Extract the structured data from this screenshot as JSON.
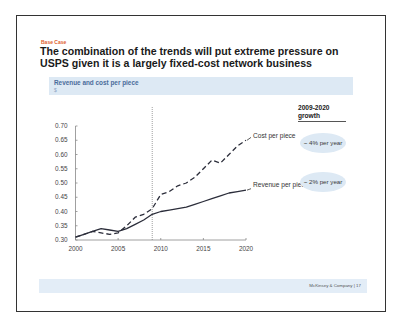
{
  "slide": {
    "tag": "Base Case",
    "title": "The combination of the trends will put extreme pressure on USPS given it is a largely fixed-cost network business",
    "chart_header": {
      "title": "Revenue and cost per piece",
      "unit": "$"
    },
    "growth": {
      "header": "2009-2020 growth",
      "cost": "~ 4% per year",
      "revenue": "~ 2% per year"
    },
    "labels": {
      "cost": "Cost per piece",
      "revenue": "Revenue per piece"
    },
    "footer": {
      "company": "McKinsey & Company",
      "separator": "|",
      "page": "17"
    },
    "colors": {
      "tag": "#e0602e",
      "header_band": "#dde9f4",
      "chart_title": "#4a6c9b",
      "line": "#2b2d3a"
    }
  },
  "chart_data": {
    "type": "line",
    "title": "Revenue and cost per piece",
    "ylabel": "$",
    "xlabel": "",
    "x": [
      2000,
      2001,
      2002,
      2003,
      2004,
      2005,
      2006,
      2007,
      2008,
      2009,
      2010,
      2011,
      2012,
      2013,
      2014,
      2015,
      2016,
      2017,
      2018,
      2019,
      2020
    ],
    "series": [
      {
        "name": "Cost per piece",
        "style": "dashed",
        "values": [
          0.31,
          0.32,
          0.33,
          0.325,
          0.32,
          0.325,
          0.35,
          0.38,
          0.39,
          0.41,
          0.46,
          0.47,
          0.49,
          0.5,
          0.52,
          0.55,
          0.58,
          0.57,
          0.6,
          0.63,
          0.65
        ]
      },
      {
        "name": "Revenue per piece",
        "style": "solid",
        "values": [
          0.31,
          0.32,
          0.33,
          0.34,
          0.335,
          0.33,
          0.34,
          0.355,
          0.37,
          0.39,
          0.4,
          0.405,
          0.41,
          0.415,
          0.425,
          0.435,
          0.445,
          0.455,
          0.465,
          0.47,
          0.475
        ]
      }
    ],
    "x_ticks": [
      "2000",
      "2005",
      "2010",
      "2015",
      "2020"
    ],
    "y_ticks": [
      "0.30",
      "0.35",
      "0.40",
      "0.45",
      "0.50",
      "0.55",
      "0.60",
      "0.65",
      "0.70"
    ],
    "xlim": [
      2000,
      2020
    ],
    "ylim": [
      0.3,
      0.7
    ],
    "grid": false,
    "annotations": [
      {
        "type": "vertical-dotted-line",
        "x": 2009
      },
      {
        "text": "~ 4% per year",
        "series": "Cost per piece",
        "period": "2009-2020 growth"
      },
      {
        "text": "~ 2% per year",
        "series": "Revenue per piece",
        "period": "2009-2020 growth"
      }
    ],
    "legend": "inline labels at right end of lines"
  }
}
